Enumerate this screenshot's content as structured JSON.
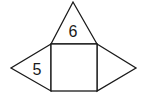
{
  "figure": {
    "type": "net",
    "stroke_color": "#1a1a1a",
    "background": "#ffffff",
    "square": {
      "x1": 51,
      "y1": 44,
      "x2": 97,
      "y2": 91,
      "label": ""
    },
    "triangles": [
      {
        "position": "top",
        "points": "51,44 73,2 97,44",
        "label": "6",
        "label_x": 73,
        "label_y": 37
      },
      {
        "position": "left",
        "points": "51,44 11,68 51,91",
        "label": "5",
        "label_x": 37,
        "label_y": 75
      },
      {
        "position": "right",
        "points": "97,44 136,68 97,91",
        "label": ""
      }
    ]
  }
}
